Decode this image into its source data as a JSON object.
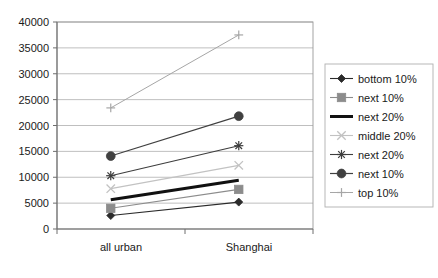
{
  "chart_data": {
    "type": "line",
    "title": "",
    "xlabel": "",
    "ylabel": "",
    "categories": [
      "all urban",
      "Shanghai"
    ],
    "ylim": [
      0,
      40000
    ],
    "ytick_values": [
      0,
      5000,
      10000,
      15000,
      20000,
      25000,
      30000,
      35000,
      40000
    ],
    "ytick_labels": [
      "0",
      "5000",
      "10000",
      "15000",
      "20000",
      "25000",
      "30000",
      "35000",
      "40000"
    ],
    "grid": true,
    "legend_position": "right",
    "series": [
      {
        "name": "bottom 10%",
        "values": [
          2600,
          5200
        ],
        "marker": "diamond",
        "color": "#2b2b2b",
        "line_width": 1.1,
        "marker_size": 4.0
      },
      {
        "name": "next 10%",
        "values": [
          4000,
          7650
        ],
        "marker": "square",
        "color": "#8c8c8c",
        "line_width": 1.1,
        "marker_size": 4.2
      },
      {
        "name": "next 20%",
        "values": [
          5650,
          9400
        ],
        "marker": "none",
        "color": "#111111",
        "line_width": 3.0,
        "marker_size": 0
      },
      {
        "name": "middle 20%",
        "values": [
          7800,
          12300
        ],
        "marker": "x",
        "color": "#c2c2c2",
        "line_width": 1.1,
        "marker_size": 4.2
      },
      {
        "name": "next 20%",
        "values": [
          10300,
          16100
        ],
        "marker": "star",
        "color": "#3d3d3d",
        "line_width": 1.1,
        "marker_size": 4.6
      },
      {
        "name": "next 10%",
        "values": [
          14100,
          21800
        ],
        "marker": "circle",
        "color": "#404040",
        "line_width": 1.2,
        "marker_size": 4.4
      },
      {
        "name": "top 10%",
        "values": [
          23400,
          37500
        ],
        "marker": "plus",
        "color": "#a6a6a6",
        "line_width": 1.0,
        "marker_size": 4.4
      }
    ]
  },
  "legend": {
    "items": [
      {
        "label": "bottom 10%"
      },
      {
        "label": "next 10%"
      },
      {
        "label": "next 20%"
      },
      {
        "label": "middle 20%"
      },
      {
        "label": "next 20%"
      },
      {
        "label": "next 10%"
      },
      {
        "label": "top 10%"
      }
    ]
  },
  "colors": {
    "axis": "#6e6e6e",
    "grid": "#b8b8b8",
    "frame": "#9a9a9a",
    "legend_border": "#b0b0b0",
    "background": "#ffffff",
    "text": "#1a1a1a"
  }
}
